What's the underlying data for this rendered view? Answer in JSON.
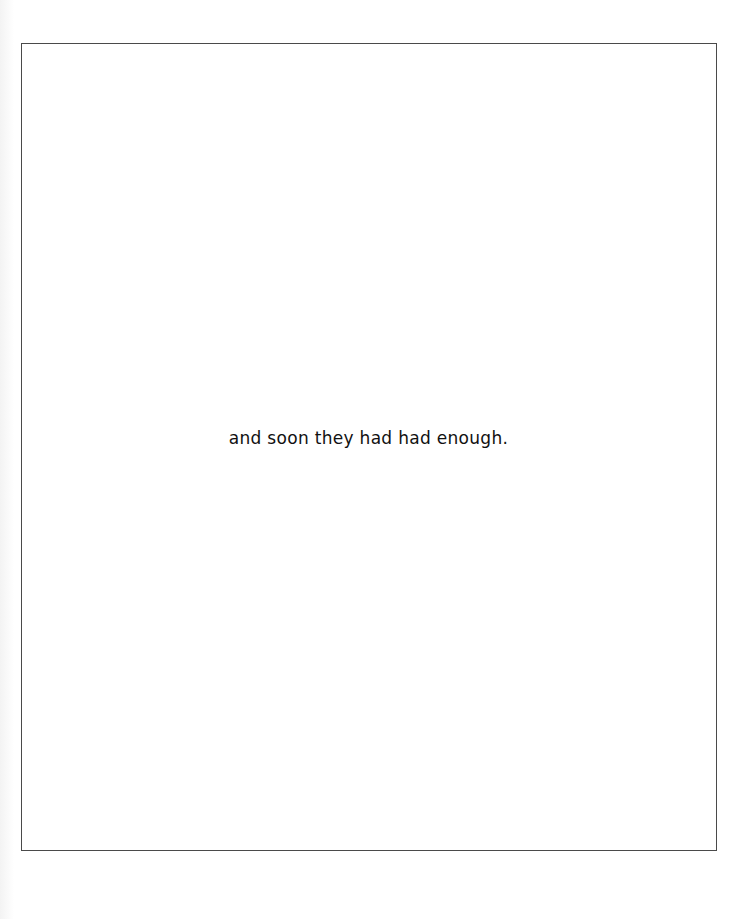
{
  "page": {
    "text": "and soon they had had enough."
  }
}
